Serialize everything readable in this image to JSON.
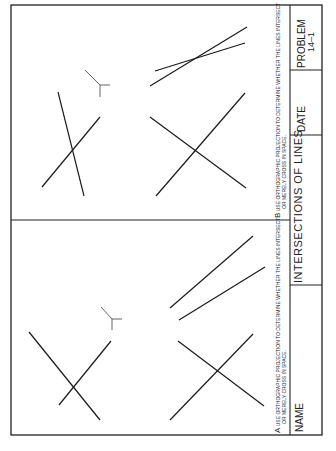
{
  "worksheet": {
    "title": "INTERSECTIONS OF LINES",
    "problem_label": "PROBLEM",
    "problem_number": "14–1",
    "date_label": "DATE",
    "name_label": "NAME"
  },
  "problems": [
    {
      "letter": "A",
      "line1": "USE ORTHOGRAPHIC PROJECTION TO DETERMINE WHETHER THE LINES INTERSECT",
      "line2": "OR MERELY CROSS IN SPACE."
    },
    {
      "letter": "B",
      "line1": "USE ORTHOGRAPHIC PROJECTION TO DETERMINE WHETHER THE LINES INTERSECT",
      "line2": "OR MERELY CROSS IN SPACE."
    }
  ],
  "icons": {
    "axis_symbol": "reference-axis-icon"
  }
}
